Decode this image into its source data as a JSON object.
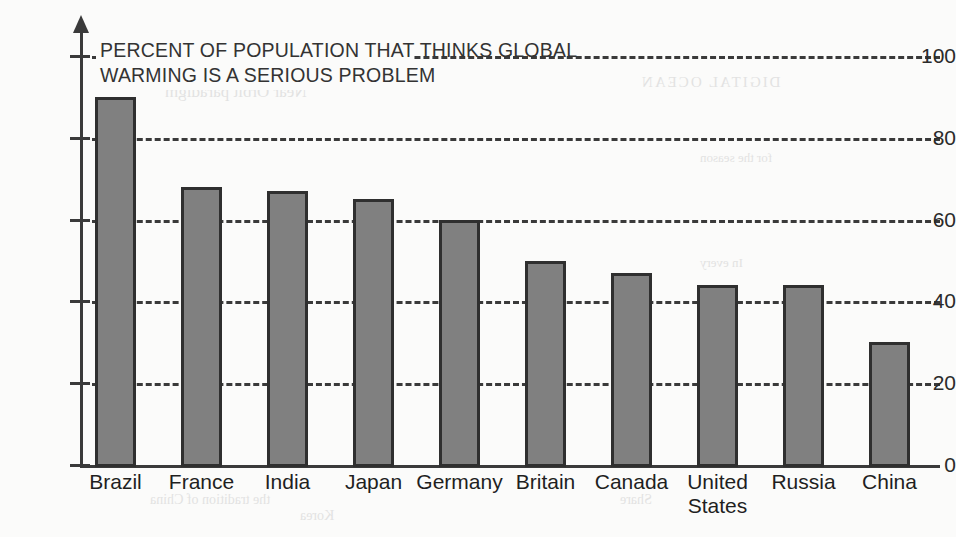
{
  "chart_data": {
    "type": "bar",
    "title": "PERCENT OF POPULATION THAT THINKS GLOBAL\nWARMING IS A SERIOUS PROBLEM",
    "xlabel": "",
    "ylabel": "",
    "ylim": [
      0,
      100
    ],
    "grid": true,
    "legend": "none",
    "yticks": [
      0,
      20,
      40,
      60,
      80,
      100
    ],
    "ytick_labels": [
      "0",
      "20",
      "40",
      "60",
      "80",
      "100"
    ],
    "categories": [
      "Brazil",
      "France",
      "India",
      "Japan",
      "Germany",
      "Britain",
      "Canada",
      "United\nStates",
      "Russia",
      "China"
    ],
    "values": [
      90,
      68,
      67,
      65,
      60,
      50,
      47,
      44,
      44,
      30
    ],
    "bar_color": "#808080",
    "bar_border_color": "#2f2f2f",
    "axis_color": "#3a3a3a",
    "background_color": "#fbfbfa"
  },
  "bleed_through": {
    "line1": "DIGITAL OCEAN",
    "line2": "Near Orbit paradigm",
    "line3": "for the season",
    "line4": "In every",
    "line5": "the tradition of China",
    "line6": "Korea",
    "line7": "Share"
  }
}
